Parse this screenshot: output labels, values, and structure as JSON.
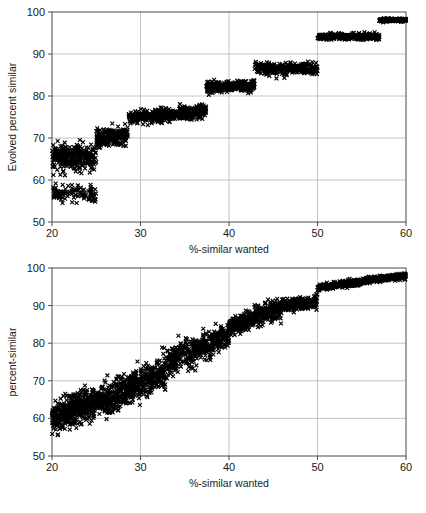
{
  "figure": {
    "background_color": "#ffffff",
    "marker_color": "#000000",
    "axis_color": "#4a4a4a",
    "grid_color": "#b5b5b5"
  },
  "charts": [
    {
      "id": "top",
      "title": "",
      "type": "scatter",
      "xlabel": "%-similar wanted",
      "ylabel": "Evolved percent similar",
      "xlim": [
        20,
        60
      ],
      "ylim": [
        50,
        100
      ],
      "xticks": [
        20,
        30,
        40,
        50,
        60
      ],
      "yticks": [
        50,
        60,
        70,
        80,
        90,
        100
      ],
      "xtick_labels": [
        "20",
        "30",
        "40",
        "50",
        "60"
      ],
      "ytick_labels": [
        "50",
        "60",
        "70",
        "80",
        "90",
        "100"
      ],
      "grid": true,
      "legend": null,
      "marker": "x",
      "description": "Staircase of discrete plateaus rising from ~62 to ~98",
      "series": [
        {
          "name": "evolved",
          "segments": [
            {
              "x_start": 20.0,
              "x_end": 25.0,
              "y_start": 65.5,
              "y_end": 65.5,
              "y_spread": 4.0,
              "n": 420,
              "bimodal_low": 57.0,
              "bimodal_spread": 2.0,
              "bimodal_fraction": 0.3
            },
            {
              "x_start": 25.0,
              "x_end": 28.6,
              "y_start": 69.8,
              "y_end": 70.6,
              "y_spread": 2.6,
              "n": 230
            },
            {
              "x_start": 28.6,
              "x_end": 37.4,
              "y_start": 75.0,
              "y_end": 76.3,
              "y_spread": 2.0,
              "n": 430
            },
            {
              "x_start": 37.4,
              "x_end": 42.9,
              "y_start": 82.2,
              "y_end": 82.3,
              "y_spread": 1.7,
              "n": 280
            },
            {
              "x_start": 42.9,
              "x_end": 50.0,
              "y_start": 86.6,
              "y_end": 86.5,
              "y_spread": 1.8,
              "n": 320
            },
            {
              "x_start": 50.0,
              "x_end": 57.0,
              "y_start": 94.1,
              "y_end": 94.1,
              "y_spread": 1.0,
              "n": 300
            },
            {
              "x_start": 57.0,
              "x_end": 60.0,
              "y_start": 98.0,
              "y_end": 98.1,
              "y_spread": 0.5,
              "n": 150
            }
          ]
        }
      ]
    },
    {
      "id": "bottom",
      "title": "",
      "type": "scatter",
      "xlabel": "%-similar wanted",
      "ylabel": "percent-similar",
      "xlim": [
        20,
        60
      ],
      "ylim": [
        50,
        100
      ],
      "xticks": [
        20,
        30,
        40,
        50,
        60
      ],
      "yticks": [
        50,
        60,
        70,
        80,
        90,
        100
      ],
      "xtick_labels": [
        "20",
        "30",
        "40",
        "50",
        "60"
      ],
      "ytick_labels": [
        "50",
        "60",
        "70",
        "80",
        "90",
        "100"
      ],
      "grid": true,
      "legend": null,
      "marker": "x",
      "description": "Continuous rising diagonal band from ~60 to ~98 with a step at x=50",
      "series": [
        {
          "name": "percent-similar",
          "segments": [
            {
              "x_start": 20.0,
              "x_end": 23.0,
              "y_start": 60.0,
              "y_end": 63.0,
              "y_spread": 5.0,
              "n": 300
            },
            {
              "x_start": 23.0,
              "x_end": 27.0,
              "y_start": 63.0,
              "y_end": 65.5,
              "y_spread": 5.5,
              "n": 300
            },
            {
              "x_start": 27.0,
              "x_end": 33.0,
              "y_start": 66.0,
              "y_end": 72.5,
              "y_spread": 5.5,
              "n": 400
            },
            {
              "x_start": 33.0,
              "x_end": 40.0,
              "y_start": 75.0,
              "y_end": 82.0,
              "y_spread": 4.5,
              "n": 420
            },
            {
              "x_start": 40.0,
              "x_end": 46.0,
              "y_start": 84.0,
              "y_end": 89.5,
              "y_spread": 3.2,
              "n": 380
            },
            {
              "x_start": 46.0,
              "x_end": 50.0,
              "y_start": 90.0,
              "y_end": 91.0,
              "y_spread": 2.2,
              "n": 260
            },
            {
              "x_start": 50.0,
              "x_end": 55.0,
              "y_start": 94.8,
              "y_end": 96.3,
              "y_spread": 1.1,
              "n": 280
            },
            {
              "x_start": 55.0,
              "x_end": 60.0,
              "y_start": 96.5,
              "y_end": 98.0,
              "y_spread": 1.0,
              "n": 280
            }
          ]
        }
      ]
    }
  ],
  "chart_data": {
    "type": "scatter",
    "panels": [
      {
        "panel": "top",
        "title": "",
        "xlabel": "%-similar wanted",
        "ylabel": "Evolved percent similar",
        "xlim": [
          20,
          60
        ],
        "ylim": [
          50,
          100
        ],
        "xticks": [
          20,
          30,
          40,
          50,
          60
        ],
        "yticks": [
          50,
          60,
          70,
          80,
          90,
          100
        ],
        "grid": true,
        "legend": "none",
        "series": [
          {
            "name": "Evolved percent similar",
            "marker": "x",
            "color": "#000000",
            "note": "Discrete staircase: plateau mean values per x-range",
            "plateaus": [
              {
                "x_range": [
                  20.0,
                  25.0
                ],
                "mean_y": 65.5,
                "min_y": 55.0,
                "max_y": 69.5
              },
              {
                "x_range": [
                  25.0,
                  28.6
                ],
                "mean_y": 70.2,
                "min_y": 64.5,
                "max_y": 73.5
              },
              {
                "x_range": [
                  28.6,
                  37.4
                ],
                "mean_y": 75.6,
                "min_y": 72.5,
                "max_y": 79.5
              },
              {
                "x_range": [
                  37.4,
                  42.9
                ],
                "mean_y": 82.2,
                "min_y": 80.2,
                "max_y": 84.2
              },
              {
                "x_range": [
                  42.9,
                  50.0
                ],
                "mean_y": 86.6,
                "min_y": 84.5,
                "max_y": 88.8
              },
              {
                "x_range": [
                  50.0,
                  57.0
                ],
                "mean_y": 94.1,
                "min_y": 93.2,
                "max_y": 95.1
              },
              {
                "x_range": [
                  57.0,
                  60.0
                ],
                "mean_y": 98.0,
                "min_y": 97.5,
                "max_y": 98.6
              }
            ]
          }
        ]
      },
      {
        "panel": "bottom",
        "title": "",
        "xlabel": "%-similar wanted",
        "ylabel": "percent-similar",
        "xlim": [
          20,
          60
        ],
        "ylim": [
          50,
          100
        ],
        "xticks": [
          20,
          30,
          40,
          50,
          60
        ],
        "yticks": [
          50,
          60,
          70,
          80,
          90,
          100
        ],
        "grid": true,
        "legend": "none",
        "series": [
          {
            "name": "percent-similar",
            "marker": "x",
            "color": "#000000",
            "note": "Continuous rising band; trend values sampled at x",
            "x": [
              20,
              22,
              24,
              26,
              28,
              30,
              32,
              34,
              36,
              38,
              40,
              42,
              44,
              46,
              48,
              50,
              52,
              54,
              56,
              58,
              60
            ],
            "y_mean": [
              60.0,
              62.5,
              64.5,
              65.5,
              67.0,
              69.5,
              72.0,
              76.5,
              79.0,
              81.5,
              84.0,
              86.5,
              88.5,
              90.0,
              90.8,
              94.8,
              95.6,
              96.2,
              96.8,
              97.4,
              98.0
            ],
            "y_spread": [
              5.0,
              5.5,
              5.5,
              5.5,
              5.5,
              5.5,
              5.0,
              4.5,
              4.5,
              4.5,
              3.5,
              3.2,
              3.0,
              2.5,
              2.2,
              1.2,
              1.1,
              1.1,
              1.0,
              1.0,
              1.0
            ]
          }
        ]
      }
    ]
  }
}
